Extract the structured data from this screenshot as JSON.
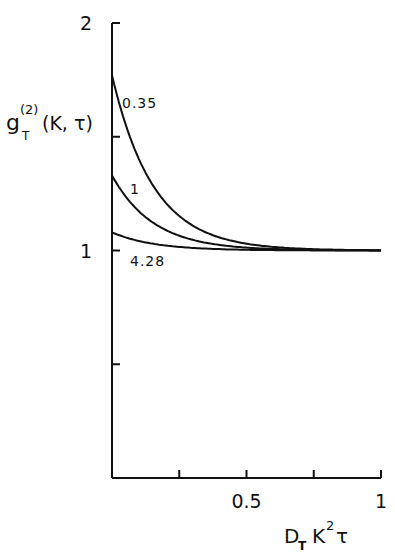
{
  "chart_data": {
    "type": "line",
    "title": "",
    "xlabel": "D_T K^2 τ",
    "ylabel": "g_T^(2)(K,τ)",
    "xlim": [
      0,
      1
    ],
    "ylim": [
      0,
      2
    ],
    "grid": false,
    "x_ticks": [
      0,
      0.25,
      0.5,
      0.75,
      1
    ],
    "x_tick_labels": [
      "",
      "",
      "0.5",
      "",
      "1"
    ],
    "y_ticks": [
      0,
      0.5,
      1,
      1.5,
      2
    ],
    "y_tick_labels": [
      "",
      "",
      "1",
      "",
      "2"
    ],
    "series": [
      {
        "name": "0.35",
        "label": "0.35",
        "intercept": 1.77,
        "decay_rate": 6.5,
        "x": [
          0,
          0.1,
          0.2,
          0.3,
          0.4,
          0.5,
          0.6,
          0.8,
          1.0
        ],
        "values": [
          1.77,
          1.41,
          1.21,
          1.11,
          1.06,
          1.03,
          1.02,
          1.0,
          1.0
        ]
      },
      {
        "name": "1",
        "label": "1",
        "intercept": 1.33,
        "decay_rate": 6.5,
        "x": [
          0,
          0.1,
          0.2,
          0.3,
          0.4,
          0.5,
          0.6,
          0.8,
          1.0
        ],
        "values": [
          1.33,
          1.17,
          1.09,
          1.05,
          1.02,
          1.01,
          1.01,
          1.0,
          1.0
        ]
      },
      {
        "name": "4.28",
        "label": "4.28",
        "intercept": 1.08,
        "decay_rate": 6.5,
        "x": [
          0,
          0.1,
          0.2,
          0.3,
          0.4,
          0.5,
          0.6,
          0.8,
          1.0
        ],
        "values": [
          1.08,
          1.04,
          1.02,
          1.01,
          1.0,
          1.0,
          1.0,
          1.0,
          1.0
        ]
      }
    ],
    "legend": "inline labels on curves"
  },
  "labels": {
    "y_axis_main": "g",
    "y_axis_sup": "(2)",
    "y_axis_sub": "T",
    "y_axis_args": "(K, τ)",
    "x_axis_D": "D",
    "x_axis_sub": "T",
    "x_axis_K": "K",
    "x_axis_sup": "2",
    "x_axis_tau": "τ"
  }
}
